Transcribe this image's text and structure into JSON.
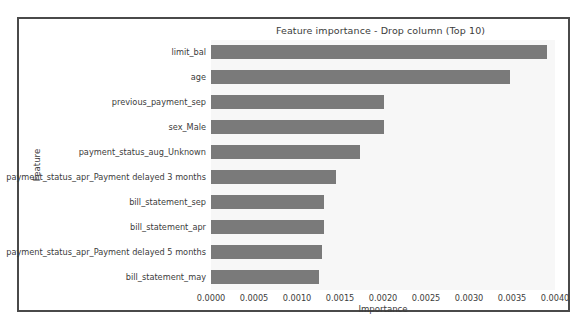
{
  "chart_data": {
    "type": "bar",
    "orientation": "horizontal",
    "title": "Feature importance - Drop column (Top 10)",
    "xlabel": "Importance",
    "ylabel": "Feature",
    "categories": [
      "limit_bal",
      "age",
      "previous_payment_sep",
      "sex_Male",
      "payment_status_aug_Unknown",
      "payment_status_apr_Payment delayed 3 months",
      "bill_statement_sep",
      "bill_statement_apr",
      "payment_status_apr_Payment delayed 5 months",
      "bill_statement_may"
    ],
    "values": [
      0.00391,
      0.00348,
      0.00201,
      0.00201,
      0.00173,
      0.00145,
      0.00131,
      0.00131,
      0.00129,
      0.00125
    ],
    "xlim": [
      0.0,
      0.004
    ],
    "xticks": [
      "0.0000",
      "0.0005",
      "0.0010",
      "0.0015",
      "0.0020",
      "0.0025",
      "0.0030",
      "0.0035",
      "0.0040"
    ],
    "xtick_values": [
      0.0,
      0.0005,
      0.001,
      0.0015,
      0.002,
      0.0025,
      0.003,
      0.0035,
      0.004
    ],
    "grid": false,
    "legend": null,
    "bar_color": "#7a7a7a",
    "plot_background": "#f7f7f7",
    "figure_background": "#ffffff",
    "frame_color": "#4a4a4a"
  }
}
